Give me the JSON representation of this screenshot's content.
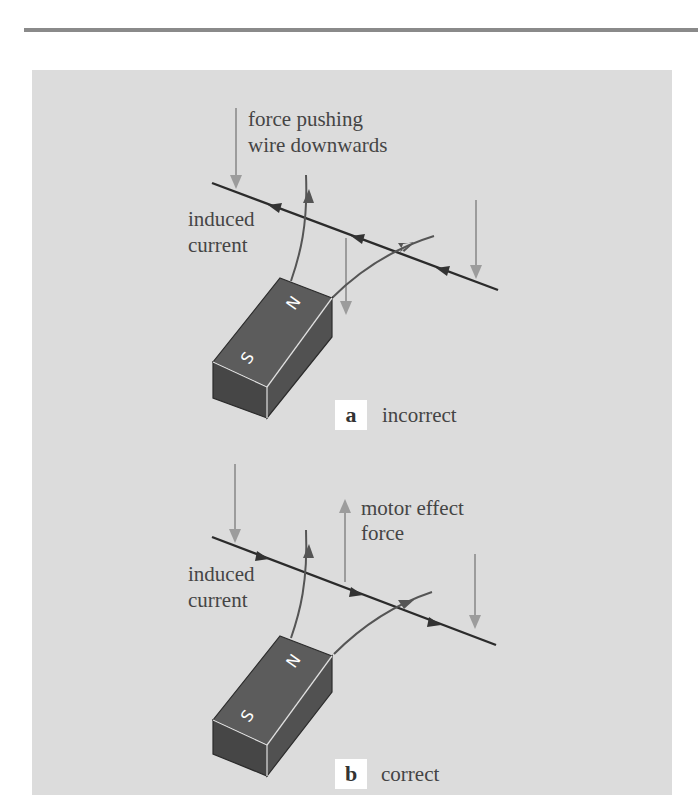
{
  "figure": {
    "colors": {
      "panel_bg": "#dcdcdc",
      "wire": "#2b2b2b",
      "field_line": "#555555",
      "force_arrow": "#9c9c9c",
      "magnet_top": "#5c5c5c",
      "magnet_front": "#464646",
      "magnet_side": "#515151",
      "text": "#454545"
    },
    "panel_a": {
      "tag": "a",
      "caption": "incorrect",
      "force_label_line1": "force pushing",
      "force_label_line2": "wire downwards",
      "current_label_line1": "induced",
      "current_label_line2": "current",
      "current_direction": "left",
      "magnet_pole_near": "S",
      "magnet_pole_far": "N"
    },
    "panel_b": {
      "tag": "b",
      "caption": "correct",
      "force_label_line1": "motor effect",
      "force_label_line2": "force",
      "current_label_line1": "induced",
      "current_label_line2": "current",
      "current_direction": "right",
      "magnet_pole_near": "S",
      "magnet_pole_far": "N"
    }
  }
}
